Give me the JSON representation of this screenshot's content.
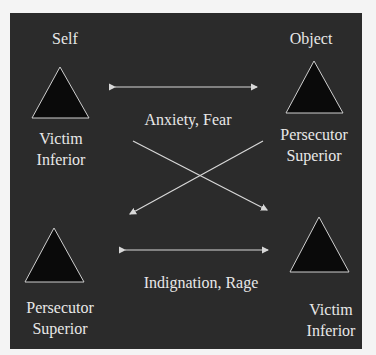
{
  "diagram": {
    "headers": {
      "self": "Self",
      "object": "Object"
    },
    "top_left": {
      "line1": "Victim",
      "line2": "Inferior"
    },
    "top_right": {
      "line1": "Persecutor",
      "line2": "Superior"
    },
    "bottom_left": {
      "line1": "Persecutor",
      "line2": "Superior"
    },
    "bottom_right": {
      "line1": "Victim",
      "line2": "Inferior"
    },
    "top_arrow_label": "Anxiety, Fear",
    "bottom_arrow_label": "Indignation, Rage",
    "colors": {
      "background": "#2b2b2b",
      "text": "#e8e8e8",
      "triangle_fill": "#0a0a0a",
      "line": "#d8d8d8"
    }
  }
}
